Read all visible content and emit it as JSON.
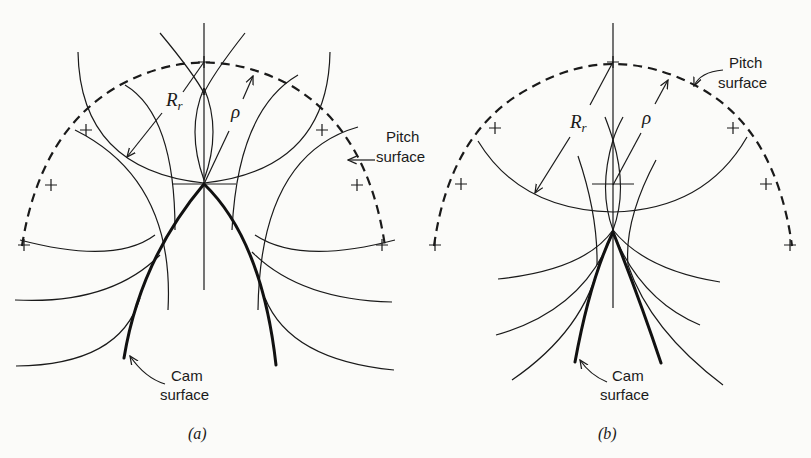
{
  "figure": {
    "panel_a": {
      "caption": "(a)",
      "labels": {
        "roller_radius_main": "R",
        "roller_radius_sub": "r",
        "rho": "ρ",
        "pitch_surface_line1": "Pitch",
        "pitch_surface_line2": "surface",
        "cam_surface_line1": "Cam",
        "cam_surface_line2": "surface"
      }
    },
    "panel_b": {
      "caption": "(b)",
      "labels": {
        "roller_radius_main": "R",
        "roller_radius_sub": "r",
        "rho": "ρ",
        "pitch_surface_line1": "Pitch",
        "pitch_surface_line2": "surface",
        "cam_surface_line1": "Cam",
        "cam_surface_line2": "surface"
      }
    }
  }
}
